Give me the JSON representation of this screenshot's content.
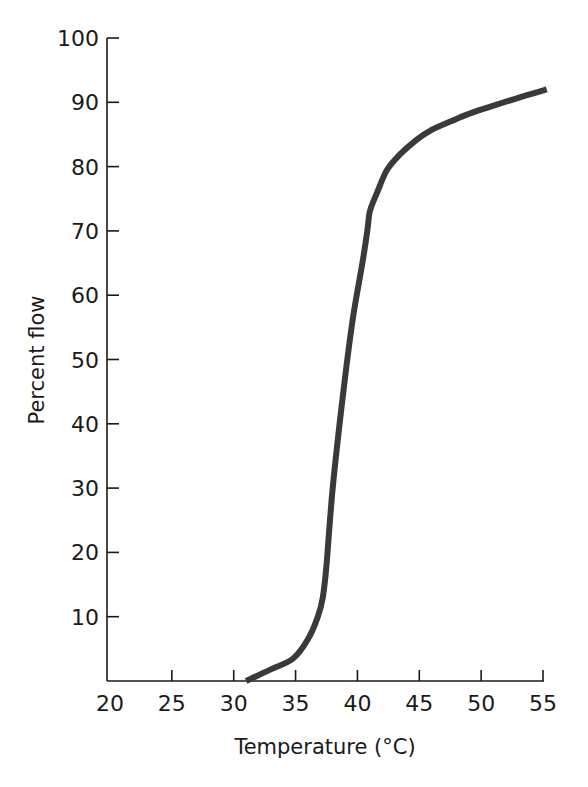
{
  "chart_data": {
    "type": "line",
    "title": "",
    "xlabel": "Temperature (°C)",
    "ylabel": "Percent flow",
    "xlim": [
      20,
      55
    ],
    "ylim": [
      0,
      100
    ],
    "x_ticks": [
      20,
      25,
      30,
      35,
      40,
      45,
      50,
      55
    ],
    "y_ticks": [
      10,
      20,
      30,
      40,
      50,
      60,
      70,
      80,
      90,
      100
    ],
    "grid": false,
    "legend": null,
    "series": [
      {
        "name": "Percent flow",
        "color": "#3a3a3a",
        "x": [
          31.0,
          33.0,
          34.8,
          36.0,
          36.8,
          37.2,
          37.5,
          38.0,
          38.8,
          39.6,
          40.4,
          40.8,
          41.0,
          41.6,
          42.4,
          43.5,
          44.8,
          46.0,
          47.5,
          49.0,
          50.7,
          53.0,
          55.3
        ],
        "y": [
          0,
          1.8,
          3.5,
          6.5,
          10,
          13,
          18,
          30,
          44,
          56,
          65,
          70,
          73,
          76,
          79.5,
          82,
          84.2,
          85.7,
          87,
          88.2,
          89.3,
          90.7,
          92
        ]
      }
    ]
  },
  "plot": {
    "x_px_min": 110,
    "x_px_max": 543,
    "y_px_min": 681,
    "y_px_max": 38,
    "axis_x_left": 107
  }
}
